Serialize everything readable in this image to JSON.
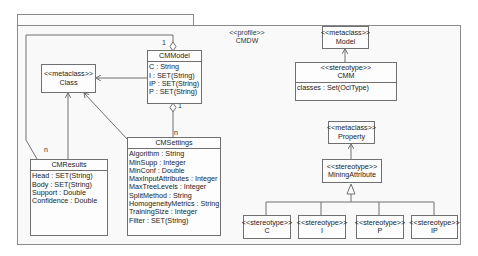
{
  "profile": {
    "stereotype": "<<profile>>",
    "name": "CMDW"
  },
  "classes": {
    "class_meta": {
      "stereotype": "<<metaclass>>",
      "name": "Class"
    },
    "cmmodel": {
      "name": "CMModel",
      "attributes": [
        "C : String",
        "I : SET(String)",
        "IP : SET(String)",
        "P : SET(String)"
      ]
    },
    "cmresults": {
      "name": "CMResults",
      "attributes": [
        "Head : SET(String)",
        "Body : SET(String)",
        "Support : Double",
        "Confidence : Double"
      ]
    },
    "cmsettings": {
      "name": "CMSettings",
      "attributes": [
        "Algorithm : String",
        "MinSupp : Integer",
        "MinConf : Double",
        "MaxInputAttributes : Integer",
        "MaxTreeLevels : Integer",
        "SplitMethod : String",
        "HomogeneityMetrics : String",
        "TrainingSize : Integer",
        "Filter : SET(String)"
      ]
    },
    "model_meta": {
      "stereotype": "<<metaclass>>",
      "name": "Model"
    },
    "cmm": {
      "stereotype": "<<stereotype>>",
      "name": "CMM",
      "attributes": [
        "classes : Set(OclType)"
      ]
    },
    "property_meta": {
      "stereotype": "<<metaclass>>",
      "name": "Property"
    },
    "mining_attribute": {
      "stereotype": "<<stereotype>>",
      "name": "MiningAttribute"
    },
    "st_c": {
      "stereotype": "<<stereotype>>",
      "name": "C"
    },
    "st_i": {
      "stereotype": "<<stereotype>>",
      "name": "I"
    },
    "st_p": {
      "stereotype": "<<stereotype>>",
      "name": "P"
    },
    "st_ip": {
      "stereotype": "<<stereotype>>",
      "name": "IP"
    }
  },
  "multiplicities": {
    "model_results_top": "1",
    "model_settings": "1",
    "settings_n": "n",
    "results_n": "n"
  },
  "colors": {
    "line": "#707070",
    "package_border": "#8a8a8a",
    "background": "#f9f9f9"
  }
}
